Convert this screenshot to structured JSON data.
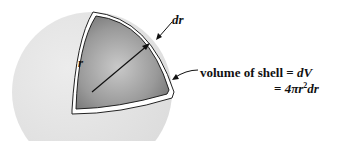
{
  "diagram": {
    "labels": {
      "radius": "r",
      "thickness": "dr",
      "volume_line1": "volume of shell = dV",
      "volume_line2": "= 4πr²dr"
    },
    "parts": {
      "volume_text": "volume of shell",
      "equals": "=",
      "dV": "dV",
      "four_pi": "4π",
      "r": "r",
      "squared": "2",
      "dr": "dr"
    },
    "colors": {
      "sphere": "#e6e6e6",
      "cutaway_dark": "#7a7a7a",
      "cutaway_light": "#c8c8c8",
      "shell_edge": "#ffffff",
      "outline": "#222222",
      "text": "#111111"
    }
  }
}
